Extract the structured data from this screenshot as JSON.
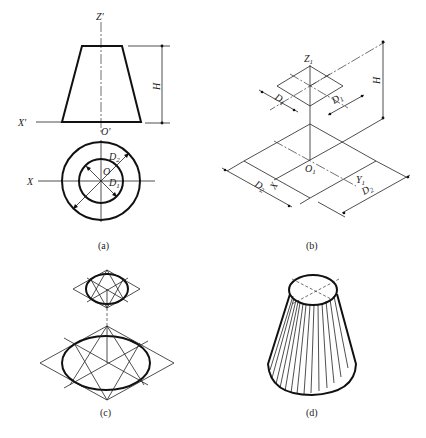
{
  "figure": {
    "panels": [
      {
        "id": "a",
        "caption": "(a)",
        "description": "Orthographic views of truncated cone (frustum)",
        "labels": {
          "z_axis": "Z'",
          "x_axis_front": "X'",
          "origin_front": "O'",
          "height": "H",
          "x_axis_top": "X",
          "origin_top": "O",
          "diameter_small": "D",
          "diameter_small_sub": "1",
          "diameter_large": "D",
          "diameter_large_sub": "2"
        }
      },
      {
        "id": "b",
        "caption": "(b)",
        "description": "Isometric construction rhombi for top and bottom circles",
        "labels": {
          "z_axis": "Z",
          "z_axis_sub": "1",
          "origin": "O",
          "origin_sub": "1",
          "x_axis": "X",
          "y_axis": "Y",
          "y_axis_sub": "1",
          "height": "H",
          "top_d_left": "D",
          "top_d_left_sub": "1",
          "top_d_right": "D",
          "top_d_right_sub": "1",
          "bottom_d_left": "D",
          "bottom_d_left_sub": "2",
          "bottom_d_right": "D",
          "bottom_d_right_sub": "2"
        }
      },
      {
        "id": "c",
        "caption": "(c)",
        "description": "Four-center approximate ellipses drawn in rhombi"
      },
      {
        "id": "d",
        "caption": "(d)",
        "description": "Finished isometric drawing of frustum with shading lines"
      }
    ]
  }
}
